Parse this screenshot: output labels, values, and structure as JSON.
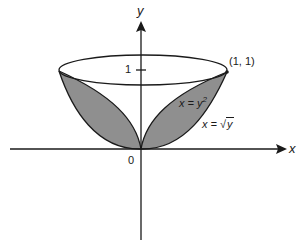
{
  "diagram": {
    "axes": {
      "x_label": "x",
      "y_label": "y",
      "origin_label": "0",
      "y_tick_label": "1"
    },
    "point_label": "(1, 1)",
    "curves": [
      {
        "name": "parabola-y-squared",
        "label_lhs": "x = y",
        "label_sup": "2"
      },
      {
        "name": "sqrt-curve",
        "label_lhs": "x = ",
        "label_rad": "y"
      }
    ],
    "colors": {
      "shade": "#8f8f8f",
      "stroke": "#1a1a1a",
      "background": "#ffffff"
    }
  }
}
